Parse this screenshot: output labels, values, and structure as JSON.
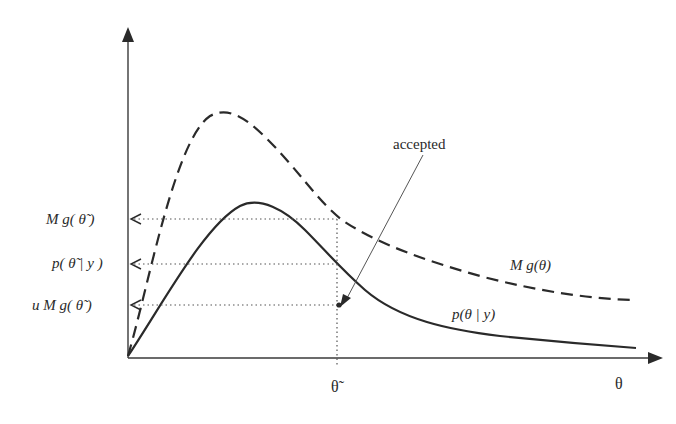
{
  "diagram": {
    "axes": {
      "x_label": "θ",
      "x_marker_label": "θ̃"
    },
    "curves": [
      {
        "name": "envelope",
        "label": "M g(θ)",
        "style": "dashed"
      },
      {
        "name": "target",
        "label": "p(θ | y)",
        "style": "solid"
      }
    ],
    "y_labels": [
      {
        "id": "mg_theta_tilde",
        "text": "M g( θ̃ )"
      },
      {
        "id": "p_theta_tilde",
        "text": "p( θ̃ | y )"
      },
      {
        "id": "umg_theta_tilde",
        "text": "u M g( θ̃ )"
      }
    ],
    "annotation": "accepted",
    "colors": {
      "line": "#2a2a2a",
      "dotted": "#555555",
      "background": "#ffffff"
    }
  }
}
